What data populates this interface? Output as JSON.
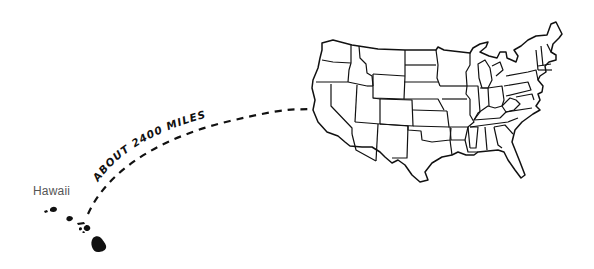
{
  "diagram": {
    "labels": {
      "hawaii": "Hawaii",
      "distance": "ABOUT 2400 MILES"
    },
    "regions": [
      {
        "name": "Hawaii",
        "type": "island-chain"
      },
      {
        "name": "Contiguous United States",
        "type": "state-map"
      }
    ],
    "connector": {
      "style": "dashed-arc",
      "from": "Hawaii",
      "to": "Contiguous United States"
    },
    "colors": {
      "ink": "#111111",
      "label": "#555555",
      "background": "#ffffff"
    }
  }
}
